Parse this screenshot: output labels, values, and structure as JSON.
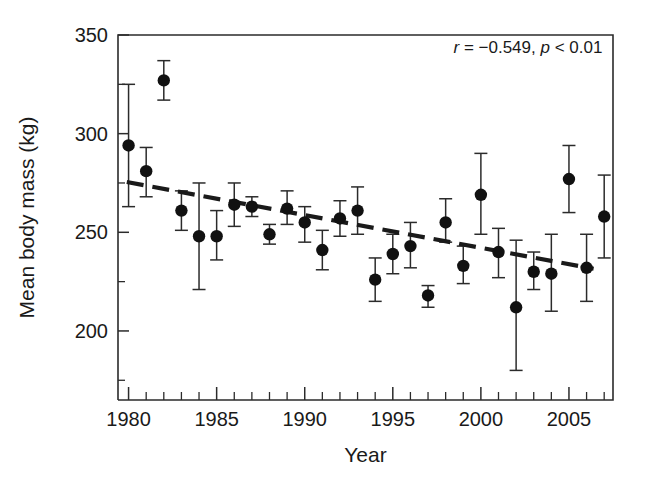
{
  "chart_data": {
    "type": "scatter",
    "title": "",
    "xlabel": "Year",
    "ylabel": "Mean body mass (kg)",
    "xlim": [
      1979.4,
      2007.5
    ],
    "ylim": [
      165,
      350
    ],
    "grid": false,
    "legend": "none",
    "x_ticks_major": [
      1980,
      1985,
      1990,
      1995,
      2000,
      2005
    ],
    "x_tick_labels": [
      "1980",
      "1985",
      "1990",
      "1995",
      "2000",
      "2005"
    ],
    "x_ticks_minor": [
      1981,
      1982,
      1983,
      1984,
      1986,
      1987,
      1988,
      1989,
      1991,
      1992,
      1993,
      1994,
      1996,
      1997,
      1998,
      1999,
      2001,
      2002,
      2003,
      2004,
      2006,
      2007
    ],
    "y_ticks_major": [
      200,
      250,
      300,
      350
    ],
    "y_tick_labels": [
      "200",
      "250",
      "300",
      "350"
    ],
    "y_ticks_minor": [
      175,
      225,
      275,
      325
    ],
    "error_bar_kind": "vertical whisker with caps",
    "x": [
      1980,
      1981,
      1982,
      1983,
      1984,
      1985,
      1986,
      1987,
      1988,
      1989,
      1990,
      1991,
      1992,
      1993,
      1994,
      1995,
      1996,
      1997,
      1998,
      1999,
      2000,
      2001,
      2002,
      2003,
      2004,
      2005,
      2006,
      2007
    ],
    "values": [
      294,
      281,
      327,
      261,
      248,
      248,
      264,
      263,
      249,
      262,
      255,
      241,
      257,
      261,
      226,
      239,
      243,
      218,
      255,
      233,
      269,
      240,
      212,
      230,
      229,
      277,
      232,
      258
    ],
    "err_low": [
      263,
      268,
      317,
      251,
      221,
      236,
      253,
      258,
      244,
      254,
      245,
      231,
      248,
      249,
      215,
      229,
      232,
      212,
      245,
      224,
      249,
      227,
      180,
      221,
      210,
      260,
      215,
      237
    ],
    "err_high": [
      325,
      293,
      337,
      271,
      275,
      261,
      275,
      268,
      254,
      271,
      263,
      251,
      266,
      273,
      237,
      249,
      255,
      223,
      267,
      243,
      290,
      252,
      246,
      240,
      249,
      294,
      249,
      279
    ],
    "series": [
      {
        "name": "Mean body mass",
        "values": [
          294,
          281,
          327,
          261,
          248,
          248,
          264,
          263,
          249,
          262,
          255,
          241,
          257,
          261,
          226,
          239,
          243,
          218,
          255,
          233,
          269,
          240,
          212,
          230,
          229,
          277,
          232,
          258
        ]
      }
    ],
    "trend": {
      "style": "dashed",
      "x_start": 1979.9,
      "y_start": 275.5,
      "x_end": 2006.4,
      "y_end": 231.5
    },
    "annotations": [
      {
        "name": "correlation-stats",
        "parts": [
          {
            "text": "r",
            "italic": true
          },
          {
            "text": " = −0.549, ",
            "italic": false
          },
          {
            "text": "p",
            "italic": true
          },
          {
            "text": " < 0.01",
            "italic": false
          }
        ],
        "full_text": "r = −0.549, p < 0.01",
        "x": 2006.9,
        "y": 341
      }
    ],
    "colors": {
      "marker": "#111111",
      "error_bar": "#2b2b2b",
      "trendline": "#1a1a1a",
      "axis": "#2b2b2b",
      "background": "#ffffff"
    }
  }
}
